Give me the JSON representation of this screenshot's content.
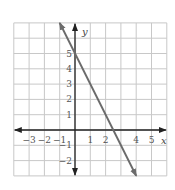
{
  "chart_data": {
    "type": "line",
    "title": "",
    "xlabel": "x",
    "ylabel": "y",
    "xlim": [
      -4,
      6
    ],
    "ylim": [
      -3,
      7
    ],
    "grid": true,
    "x_tick_labels": [
      "−3",
      "−2",
      "−1",
      "1",
      "2",
      "4",
      "5"
    ],
    "x_ticks": [
      -3,
      -2,
      -1,
      1,
      2,
      4,
      5
    ],
    "y_tick_labels": [
      "5",
      "4",
      "3",
      "2",
      "1",
      "−1",
      "−2"
    ],
    "y_ticks": [
      5,
      4,
      3,
      2,
      1,
      -1,
      -2
    ],
    "series": [
      {
        "name": "line",
        "equation": "y = -2x + 5",
        "x": [
          -1,
          0,
          2.5,
          4
        ],
        "y": [
          7,
          5,
          0,
          -3
        ],
        "arrows": "both ends"
      }
    ]
  },
  "colors": {
    "grid": "#c8c8c8",
    "axes": "#222222",
    "line": "#6b6b6b",
    "labels": "#555555"
  }
}
